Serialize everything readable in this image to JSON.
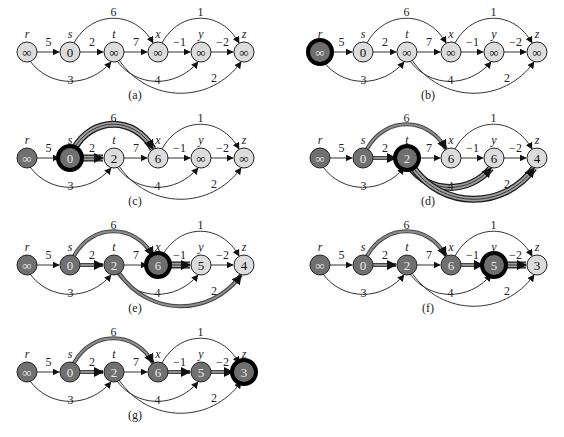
{
  "colors": {
    "white_node": "#d9d9d9",
    "black_node": "#6e6e6e",
    "gray_highlight": "#000000",
    "edge": "#333333",
    "shaded_edge_outer": "#222222",
    "shaded_edge_inner": "#9a9a9a",
    "text": "#222222"
  },
  "vertices": [
    "r",
    "s",
    "t",
    "x",
    "y",
    "z"
  ],
  "edges": [
    {
      "from": "r",
      "to": "s",
      "w": "5",
      "kind": "straight"
    },
    {
      "from": "r",
      "to": "t",
      "w": "3",
      "kind": "below-short"
    },
    {
      "from": "s",
      "to": "t",
      "w": "2",
      "kind": "straight"
    },
    {
      "from": "s",
      "to": "x",
      "w": "6",
      "kind": "above"
    },
    {
      "from": "t",
      "to": "x",
      "w": "7",
      "kind": "straight"
    },
    {
      "from": "t",
      "to": "y",
      "w": "4",
      "kind": "below-short"
    },
    {
      "from": "t",
      "to": "z",
      "w": "2",
      "kind": "below-long"
    },
    {
      "from": "x",
      "to": "y",
      "w": "−1",
      "kind": "straight"
    },
    {
      "from": "x",
      "to": "z",
      "w": "1",
      "kind": "above"
    },
    {
      "from": "y",
      "to": "z",
      "w": "−2",
      "kind": "straight"
    }
  ],
  "panels": [
    {
      "caption": "(a)",
      "values": {
        "r": "∞",
        "s": "0",
        "t": "∞",
        "x": "∞",
        "y": "∞",
        "z": "∞"
      },
      "black": [],
      "current": null,
      "shaded": [],
      "relaxing": []
    },
    {
      "caption": "(b)",
      "values": {
        "r": "∞",
        "s": "0",
        "t": "∞",
        "x": "∞",
        "y": "∞",
        "z": "∞"
      },
      "black": [],
      "current": "r",
      "shaded": [],
      "relaxing": []
    },
    {
      "caption": "(c)",
      "values": {
        "r": "∞",
        "s": "0",
        "t": "2",
        "x": "6",
        "y": "∞",
        "z": "∞"
      },
      "black": [
        "r"
      ],
      "current": "s",
      "shaded": [],
      "relaxing": [
        "s-t",
        "s-x"
      ]
    },
    {
      "caption": "(d)",
      "values": {
        "r": "∞",
        "s": "0",
        "t": "2",
        "x": "6",
        "y": "6",
        "z": "4"
      },
      "black": [
        "r",
        "s"
      ],
      "current": "t",
      "shaded": [
        "s-t",
        "s-x"
      ],
      "relaxing": [
        "t-y",
        "t-z"
      ]
    },
    {
      "caption": "(e)",
      "values": {
        "r": "∞",
        "s": "0",
        "t": "2",
        "x": "6",
        "y": "5",
        "z": "4"
      },
      "black": [
        "r",
        "s",
        "t"
      ],
      "current": "x",
      "shaded": [
        "s-t",
        "s-x",
        "t-z"
      ],
      "relaxing": [
        "x-y"
      ]
    },
    {
      "caption": "(f)",
      "values": {
        "r": "∞",
        "s": "0",
        "t": "2",
        "x": "6",
        "y": "5",
        "z": "3"
      },
      "black": [
        "r",
        "s",
        "t",
        "x"
      ],
      "current": "y",
      "shaded": [
        "s-t",
        "s-x",
        "x-y"
      ],
      "relaxing": [
        "y-z"
      ]
    },
    {
      "caption": "(g)",
      "values": {
        "r": "∞",
        "s": "0",
        "t": "2",
        "x": "6",
        "y": "5",
        "z": "3"
      },
      "black": [
        "r",
        "s",
        "t",
        "x",
        "y"
      ],
      "current": "z",
      "shaded": [
        "s-t",
        "s-x",
        "x-y",
        "y-z"
      ],
      "relaxing": []
    }
  ]
}
